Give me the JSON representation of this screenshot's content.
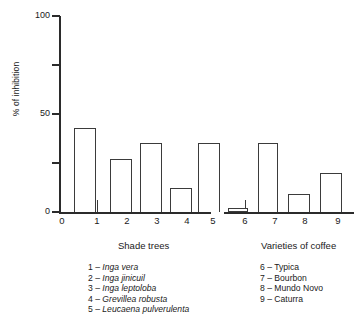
{
  "chart_data": {
    "type": "bar",
    "title": "",
    "xlabel": "",
    "ylabel": "% of inhibition",
    "ylim": [
      0,
      100
    ],
    "yticks": [
      0,
      50,
      100
    ],
    "ytick_labels": [
      "0",
      "50",
      "100"
    ],
    "minor_yticks": [
      25,
      75
    ],
    "grid": false,
    "legend_position": "below-axes",
    "categories": [
      "1",
      "2",
      "3",
      "4",
      "5",
      "6",
      "7",
      "8",
      "9"
    ],
    "values": [
      43,
      27,
      35,
      12,
      35,
      2,
      35,
      9,
      20
    ],
    "groups": [
      {
        "label": "Shade trees",
        "categories": [
          "1",
          "2",
          "3",
          "4",
          "5"
        ]
      },
      {
        "label": "Varieties of coffee",
        "categories": [
          "6",
          "7",
          "8",
          "9"
        ]
      }
    ],
    "bar_color": "#ffffff",
    "bar_edge_color": "#3b3b3b",
    "axis_color": "#2b2b2b"
  },
  "axes": {
    "y_label": "% of inhibition",
    "y_ticks": [
      {
        "value": 100,
        "label": "100"
      },
      {
        "value": 75,
        "label": ""
      },
      {
        "value": 50,
        "label": "50"
      },
      {
        "value": 25,
        "label": ""
      },
      {
        "value": 0,
        "label": "0"
      }
    ],
    "x_ticks": [
      {
        "label": "0"
      },
      {
        "label": "1"
      },
      {
        "label": "2"
      },
      {
        "label": "3"
      },
      {
        "label": "4"
      },
      {
        "label": "5"
      },
      {
        "label": "6"
      },
      {
        "label": "7"
      },
      {
        "label": "8"
      },
      {
        "label": "9"
      }
    ]
  },
  "group_captions": {
    "left": "Shade trees",
    "right": "Varieties of coffee"
  },
  "legend_left": [
    {
      "num": "1",
      "dash": "–",
      "name": "Inga vera",
      "italic": true
    },
    {
      "num": "2",
      "dash": "–",
      "name": "Inga jinicuil",
      "italic": true
    },
    {
      "num": "3",
      "dash": "–",
      "name": "Inga leptoloba",
      "italic": true
    },
    {
      "num": "4",
      "dash": "–",
      "name": "Grevillea robusta",
      "italic": true
    },
    {
      "num": "5",
      "dash": "–",
      "name": "Leucaena pulverulenta",
      "italic": true
    }
  ],
  "legend_right": [
    {
      "num": "6",
      "dash": "–",
      "name": "Typica",
      "italic": false
    },
    {
      "num": "7",
      "dash": "–",
      "name": "Bourbon",
      "italic": false
    },
    {
      "num": "8",
      "dash": "–",
      "name": "Mundo Novo",
      "italic": false
    },
    {
      "num": "9",
      "dash": "–",
      "name": "Caturra",
      "italic": false
    }
  ]
}
